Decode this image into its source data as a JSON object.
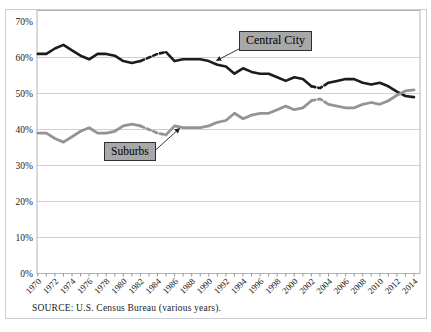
{
  "figure": {
    "source_note": "SOURCE:  U.S. Census Bureau (various years).",
    "annotations": {
      "central_city": "Central City",
      "suburbs": "Suburbs"
    }
  },
  "chart_data": {
    "type": "line",
    "title": "",
    "xlabel": "",
    "ylabel": "",
    "x": [
      1970,
      1971,
      1972,
      1973,
      1974,
      1975,
      1976,
      1977,
      1978,
      1979,
      1980,
      1981,
      1982,
      1983,
      1984,
      1985,
      1986,
      1987,
      1988,
      1989,
      1990,
      1991,
      1992,
      1993,
      1994,
      1995,
      1996,
      1997,
      1998,
      1999,
      2000,
      2001,
      2002,
      2003,
      2004,
      2005,
      2006,
      2007,
      2008,
      2009,
      2010,
      2011,
      2012,
      2013,
      2014
    ],
    "x_tick_labels": [
      "1970",
      "1972",
      "1974",
      "1976",
      "1978",
      "1980",
      "1982",
      "1984",
      "1986",
      "1988",
      "1990",
      "1992",
      "1994",
      "1996",
      "1998",
      "2000",
      "2002",
      "2004",
      "2006",
      "2008",
      "2010",
      "2012",
      "2014"
    ],
    "y_tick_labels": [
      "0%",
      "10%",
      "20%",
      "30%",
      "40%",
      "50%",
      "60%",
      "70%"
    ],
    "ylim": [
      0,
      70
    ],
    "y_tick_step": 10,
    "grid": "horizontal",
    "legend_position": "annotated-callouts-with-arrows",
    "series": [
      {
        "name": "Central City",
        "color": "#1c1c1c",
        "line_width": 2.6,
        "values": [
          61,
          61,
          62.5,
          63.5,
          62,
          60.5,
          59.5,
          61,
          61,
          60.5,
          59,
          58.5,
          59,
          60,
          61,
          61.5,
          59,
          59.5,
          59.5,
          59.5,
          59,
          58,
          57.5,
          55.5,
          57,
          56,
          55.5,
          55.5,
          54.5,
          53.5,
          54.5,
          54,
          52,
          51.5,
          53,
          53.5,
          54,
          54,
          53,
          52.5,
          53,
          52,
          50.5,
          49.3,
          49
        ]
      },
      {
        "name": "Suburbs",
        "color": "#949494",
        "line_width": 2.8,
        "values": [
          39,
          39,
          37.5,
          36.5,
          38,
          39.5,
          40.5,
          39,
          39,
          39.5,
          41,
          41.5,
          41,
          40,
          39,
          38.5,
          41,
          40.5,
          40.5,
          40.5,
          41,
          42,
          42.5,
          44.5,
          43,
          44,
          44.5,
          44.5,
          45.5,
          46.5,
          45.5,
          46,
          48,
          48.5,
          47,
          46.5,
          46,
          46,
          47,
          47.5,
          47,
          48,
          49.5,
          50.7,
          51
        ]
      }
    ],
    "dashed_x_ranges": [
      [
        1982,
        1985
      ],
      [
        2002,
        2004
      ]
    ],
    "annotations": [
      {
        "text": "Central City",
        "arrow_from_x": 239,
        "arrow_from_y": 49,
        "arrow_to_x": 216.5,
        "arrow_to_y": 60.5
      },
      {
        "text": "Suburbs",
        "arrow_from_x": 155,
        "arrow_from_y": 150.5,
        "arrow_to_x": 179.5,
        "arrow_to_y": 128.5
      }
    ]
  },
  "colors": {
    "grid": "#cfcfcf",
    "plot_border": "#b3b3b3",
    "outer_border": "#c9ced3",
    "tick": "#8a8a8a",
    "text": "#1a1a1a",
    "arrow": "#222222",
    "callout_bg": "#a8a8a8",
    "callout_border": "#2f2f2f"
  }
}
